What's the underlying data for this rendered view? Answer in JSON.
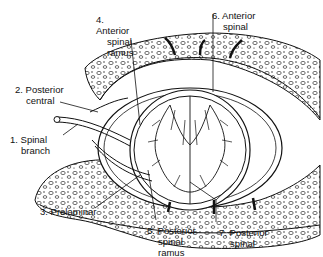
{
  "figure": {
    "line_color": "#111111",
    "background": "#ffffff"
  },
  "labels": [
    {
      "num": "1.",
      "line1": "Spinal",
      "line2": "branch"
    },
    {
      "num": "2.",
      "line1": "Posterior",
      "line2": "central"
    },
    {
      "num": "3.",
      "line1": "Prelaminar",
      "line2": ""
    },
    {
      "num": "4.",
      "line1": "Anterior",
      "line2": "spinal",
      "line3": "ramus"
    },
    {
      "num": "5.",
      "line1": "Posterior",
      "line2": "spinal",
      "line3": "ramus"
    },
    {
      "num": "6.",
      "line1": "Anterior",
      "line2": "spinal"
    },
    {
      "num": "7.",
      "line1": "Posterior",
      "line2": "spinal"
    }
  ]
}
